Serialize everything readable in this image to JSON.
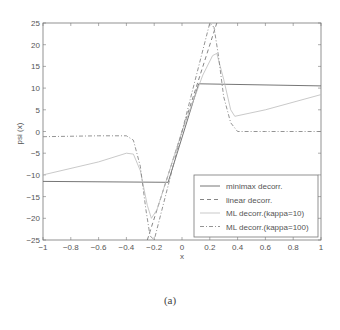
{
  "caption": "(a)",
  "chart_data": {
    "type": "line",
    "title": "",
    "xlabel": "x",
    "ylabel": "psi (x)",
    "xlim": [
      -1,
      1
    ],
    "ylim": [
      -25,
      25
    ],
    "xticks": [
      "-1",
      "-0.8",
      "-0.6",
      "-0.4",
      "-0.2",
      "0",
      "0.2",
      "0.4",
      "0.6",
      "0.8",
      "1"
    ],
    "yticks": [
      "25",
      "20",
      "15",
      "10",
      "5",
      "0",
      "-5",
      "-10",
      "-15",
      "-20",
      "-25"
    ],
    "grid": false,
    "legend_position": "lower right",
    "series": [
      {
        "name": "minimax decorr.",
        "style": "solid",
        "color": "#666666",
        "x": [
          -1,
          -0.1,
          0.12,
          1
        ],
        "y": [
          -11.5,
          -11.7,
          11,
          10.5
        ]
      },
      {
        "name": "linear decorr.",
        "style": "dashed",
        "color": "#777777",
        "x": [
          -0.25,
          0.25
        ],
        "y": [
          -25,
          25
        ]
      },
      {
        "name": "ML decorr.(kappa=10)",
        "style": "dotted",
        "color": "#bbbbbb",
        "x": [
          -1,
          -0.6,
          -0.4,
          -0.35,
          -0.3,
          -0.25,
          -0.22,
          -0.18,
          0,
          0.15,
          0.22,
          0.25,
          0.3,
          0.35,
          0.38,
          0.6,
          1
        ],
        "y": [
          -10,
          -7,
          -5,
          -5.2,
          -9,
          -17,
          -20,
          -18,
          0,
          13,
          17.5,
          18,
          12,
          5,
          3.5,
          5,
          8.5
        ]
      },
      {
        "name": "ML decorr.(kappa=100)",
        "style": "dashdot",
        "color": "#888888",
        "x": [
          -1,
          -0.6,
          -0.4,
          -0.35,
          -0.3,
          -0.26,
          -0.23,
          -0.2,
          0,
          0.2,
          0.23,
          0.26,
          0.3,
          0.35,
          0.4,
          0.6,
          1
        ],
        "y": [
          -1.2,
          -1,
          -1,
          -2,
          -8,
          -18,
          -24,
          -25,
          0,
          25,
          24,
          18,
          8,
          2,
          0,
          0,
          0
        ]
      }
    ]
  }
}
